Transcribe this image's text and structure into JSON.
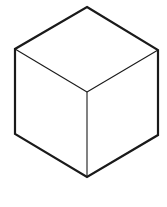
{
  "diagram": {
    "type": "isometric-cube",
    "background": "#ffffff",
    "stroke_color": "#1a1a1a",
    "outline_width": 2.2,
    "inner_width": 1.1,
    "vertices": {
      "top": [
        87,
        7
      ],
      "left_top": [
        15,
        49
      ],
      "right_top": [
        158,
        50
      ],
      "center": [
        87,
        92
      ],
      "left_bottom": [
        15,
        134
      ],
      "right_bottom": [
        158,
        135
      ],
      "bottom": [
        87,
        177
      ]
    }
  }
}
